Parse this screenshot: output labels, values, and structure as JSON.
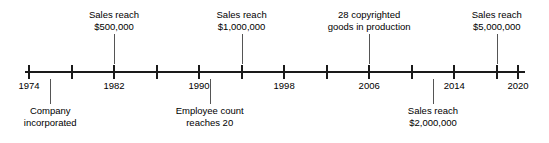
{
  "chart_data": {
    "type": "timeline",
    "title": "",
    "xlabel": "",
    "ylabel": "",
    "xlim": [
      1974,
      2020
    ],
    "tick_step": 4,
    "grid": false,
    "legend": "none",
    "axis_color": "#1a1a1a",
    "leader_color": "#555555",
    "text_color": "#000000",
    "ticks": [
      {
        "year": 1974,
        "label": "1974",
        "labeled": true
      },
      {
        "year": 1978,
        "label": "",
        "labeled": false
      },
      {
        "year": 1982,
        "label": "1982",
        "labeled": true
      },
      {
        "year": 1986,
        "label": "",
        "labeled": false
      },
      {
        "year": 1990,
        "label": "1990",
        "labeled": true
      },
      {
        "year": 1994,
        "label": "",
        "labeled": false
      },
      {
        "year": 1998,
        "label": "1998",
        "labeled": true
      },
      {
        "year": 2002,
        "label": "",
        "labeled": false
      },
      {
        "year": 2006,
        "label": "2006",
        "labeled": true
      },
      {
        "year": 2010,
        "label": "",
        "labeled": false
      },
      {
        "year": 2014,
        "label": "2014",
        "labeled": true
      },
      {
        "year": 2018,
        "label": "",
        "labeled": false
      },
      {
        "year": 2020,
        "label": "2020",
        "labeled": true
      }
    ],
    "events": [
      {
        "id": "sales-500k",
        "side": "above",
        "year": 1982,
        "lines": [
          "Sales reach",
          "$500,000"
        ]
      },
      {
        "id": "sales-1m",
        "side": "above",
        "year": 1994,
        "lines": [
          "Sales reach",
          "$1,000,000"
        ]
      },
      {
        "id": "copyrighted-goods",
        "side": "above",
        "year": 2006,
        "lines": [
          "28 copyrighted",
          "goods in production"
        ]
      },
      {
        "id": "sales-5m",
        "side": "above",
        "year": 2018,
        "lines": [
          "Sales reach",
          "$5,000,000"
        ]
      },
      {
        "id": "company-incorporated",
        "side": "below",
        "year": 1976,
        "lines": [
          "Company",
          "incorporated"
        ]
      },
      {
        "id": "employee-count-20",
        "side": "below",
        "year": 1991,
        "lines": [
          "Employee count",
          "reaches 20"
        ]
      },
      {
        "id": "sales-2m",
        "side": "below",
        "year": 2012,
        "lines": [
          "Sales reach",
          "$2,000,000"
        ]
      }
    ]
  }
}
